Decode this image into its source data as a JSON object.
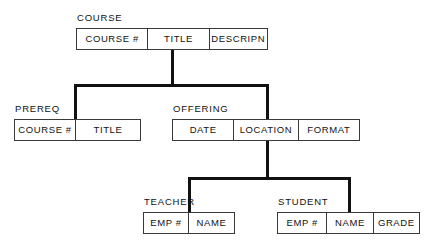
{
  "diagram": {
    "type": "hierarchical-data-structure",
    "segments": [
      {
        "id": "course",
        "label": "COURSE",
        "level": 1,
        "fields": [
          "COURSE #",
          "TITLE",
          "DESCRIPN"
        ]
      },
      {
        "id": "prereq",
        "label": "PREREQ",
        "level": 2,
        "parent": "course",
        "fields": [
          "COURSE #",
          "TITLE"
        ]
      },
      {
        "id": "offering",
        "label": "OFFERING",
        "level": 2,
        "parent": "course",
        "fields": [
          "DATE",
          "LOCATION",
          "FORMAT"
        ]
      },
      {
        "id": "teacher",
        "label": "TEACHER",
        "level": 3,
        "parent": "offering",
        "fields": [
          "EMP #",
          "NAME"
        ]
      },
      {
        "id": "student",
        "label": "STUDENT",
        "level": 3,
        "parent": "offering",
        "fields": [
          "EMP #",
          "NAME",
          "GRADE"
        ]
      }
    ],
    "colors": {
      "line": "#111111",
      "box_border": "#3a3a3a",
      "text": "#111111",
      "background": "#ffffff"
    }
  }
}
